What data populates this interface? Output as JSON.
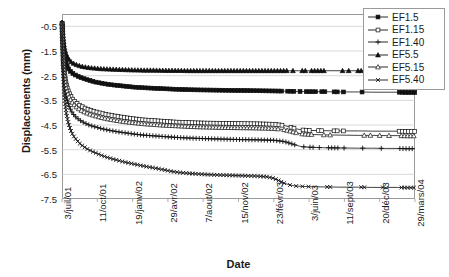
{
  "chart_data": {
    "type": "line",
    "title": "",
    "xlabel": "Date",
    "ylabel": "Displacements (mm)",
    "ylim": [
      -7.5,
      0.0
    ],
    "yticks": [
      -0.5,
      -1.5,
      -2.5,
      -3.5,
      -4.5,
      -5.5,
      -6.5,
      -7.5
    ],
    "ytick_labels": [
      "-0.5",
      "-1.5",
      "-2.5",
      "-3.5",
      "-4.5",
      "-5.5",
      "-6.5",
      "-7.5"
    ],
    "xlim": [
      0,
      1000
    ],
    "xticks": [
      0,
      100,
      200,
      300,
      400,
      500,
      600,
      700,
      800,
      900,
      1000
    ],
    "xtick_labels": [
      "3/juil/01",
      "11/oct/01",
      "19/janv/02",
      "29/avr/02",
      "7/aout/02",
      "15/nov/02",
      "23/févr/03",
      "3/juin/03",
      "11/sept/03",
      "20/déc/03",
      "29/mars/04"
    ],
    "grid": "horizontal",
    "legend_position": "top-right",
    "series": [
      {
        "name": "EF1.5",
        "marker": "filled-square",
        "color": "#111111",
        "x": [
          0,
          2,
          4,
          6,
          9,
          12,
          16,
          20,
          25,
          30,
          36,
          42,
          50,
          58,
          66,
          75,
          85,
          95,
          110,
          125,
          140,
          160,
          180,
          200,
          230,
          260,
          290,
          320,
          360,
          400,
          450,
          500,
          550,
          600,
          640,
          670,
          700,
          740,
          790,
          840,
          880,
          920,
          950,
          975,
          990,
          1000
        ],
        "y": [
          -0.25,
          -0.9,
          -1.35,
          -1.62,
          -1.86,
          -2.02,
          -2.16,
          -2.26,
          -2.34,
          -2.4,
          -2.46,
          -2.5,
          -2.56,
          -2.6,
          -2.64,
          -2.68,
          -2.72,
          -2.76,
          -2.8,
          -2.84,
          -2.87,
          -2.9,
          -2.93,
          -2.96,
          -2.99,
          -3.01,
          -3.03,
          -3.05,
          -3.07,
          -3.08,
          -3.09,
          -3.1,
          -3.11,
          -3.12,
          -3.13,
          -3.14,
          -3.15,
          -3.15,
          -3.16,
          -3.16,
          -3.17,
          -3.17,
          -3.17,
          -3.18,
          -3.18,
          -3.18
        ]
      },
      {
        "name": "EF1.15",
        "marker": "open-square",
        "color": "#111111",
        "x": [
          0,
          2,
          4,
          6,
          9,
          12,
          16,
          20,
          25,
          30,
          36,
          42,
          50,
          58,
          66,
          75,
          85,
          95,
          110,
          125,
          140,
          160,
          180,
          200,
          230,
          260,
          290,
          320,
          360,
          400,
          450,
          500,
          550,
          600,
          630,
          650,
          665,
          680,
          700,
          740,
          790,
          840,
          880,
          920,
          950,
          975,
          990,
          1000
        ],
        "y": [
          -0.25,
          -1.1,
          -1.8,
          -2.25,
          -2.6,
          -2.85,
          -3.05,
          -3.2,
          -3.34,
          -3.45,
          -3.55,
          -3.62,
          -3.7,
          -3.76,
          -3.82,
          -3.87,
          -3.92,
          -3.96,
          -4.02,
          -4.07,
          -4.11,
          -4.16,
          -4.2,
          -4.24,
          -4.29,
          -4.32,
          -4.35,
          -4.38,
          -4.4,
          -4.42,
          -4.43,
          -4.44,
          -4.45,
          -4.47,
          -4.52,
          -4.6,
          -4.66,
          -4.7,
          -4.72,
          -4.73,
          -4.74,
          -4.74,
          -4.75,
          -4.75,
          -4.75,
          -4.76,
          -4.76,
          -4.76
        ]
      },
      {
        "name": "EF1.40",
        "marker": "plus",
        "color": "#111111",
        "x": [
          0,
          2,
          4,
          6,
          9,
          12,
          16,
          20,
          25,
          30,
          36,
          42,
          50,
          58,
          66,
          75,
          85,
          95,
          110,
          125,
          140,
          160,
          180,
          200,
          230,
          260,
          290,
          320,
          360,
          400,
          450,
          500,
          550,
          600,
          630,
          650,
          665,
          680,
          700,
          740,
          790,
          840,
          880,
          920,
          950,
          975,
          990,
          1000
        ],
        "y": [
          -0.25,
          -1.25,
          -2.05,
          -2.6,
          -3.0,
          -3.3,
          -3.55,
          -3.74,
          -3.9,
          -4.02,
          -4.13,
          -4.21,
          -4.3,
          -4.37,
          -4.43,
          -4.49,
          -4.54,
          -4.58,
          -4.64,
          -4.69,
          -4.73,
          -4.78,
          -4.82,
          -4.86,
          -4.91,
          -4.94,
          -4.97,
          -5.0,
          -5.03,
          -5.05,
          -5.07,
          -5.09,
          -5.1,
          -5.12,
          -5.17,
          -5.26,
          -5.33,
          -5.38,
          -5.4,
          -5.42,
          -5.43,
          -5.44,
          -5.44,
          -5.45,
          -5.45,
          -5.46,
          -5.46,
          -5.46
        ]
      },
      {
        "name": "EF5.5",
        "marker": "filled-triangle",
        "color": "#111111",
        "x": [
          0,
          2,
          4,
          6,
          9,
          12,
          16,
          20,
          25,
          30,
          36,
          42,
          50,
          58,
          66,
          75,
          85,
          95,
          110,
          125,
          140,
          160,
          180,
          200,
          230,
          260,
          290,
          320,
          360,
          400,
          450,
          500,
          550,
          600,
          640,
          670,
          700,
          740,
          790,
          840,
          880,
          920,
          950,
          975,
          990,
          1000
        ],
        "y": [
          -0.25,
          -0.7,
          -1.05,
          -1.3,
          -1.5,
          -1.64,
          -1.76,
          -1.85,
          -1.93,
          -1.98,
          -2.03,
          -2.06,
          -2.1,
          -2.13,
          -2.15,
          -2.17,
          -2.19,
          -2.2,
          -2.22,
          -2.23,
          -2.24,
          -2.25,
          -2.26,
          -2.27,
          -2.28,
          -2.28,
          -2.29,
          -2.29,
          -2.3,
          -2.3,
          -2.3,
          -2.3,
          -2.3,
          -2.3,
          -2.3,
          -2.3,
          -2.3,
          -2.3,
          -2.3,
          -2.3,
          -2.3,
          -2.3,
          -2.3,
          -2.3,
          -2.3,
          -2.3
        ]
      },
      {
        "name": "EF5.15",
        "marker": "open-triangle",
        "color": "#111111",
        "x": [
          0,
          2,
          4,
          6,
          9,
          12,
          16,
          20,
          25,
          30,
          36,
          42,
          50,
          58,
          66,
          75,
          85,
          95,
          110,
          125,
          140,
          160,
          180,
          200,
          230,
          260,
          290,
          320,
          360,
          400,
          450,
          500,
          550,
          600,
          630,
          650,
          665,
          680,
          700,
          740,
          790,
          840,
          880,
          920,
          950,
          975,
          990,
          1000
        ],
        "y": [
          -0.25,
          -1.15,
          -1.9,
          -2.38,
          -2.74,
          -3.0,
          -3.2,
          -3.36,
          -3.5,
          -3.6,
          -3.71,
          -3.78,
          -3.87,
          -3.93,
          -3.99,
          -4.04,
          -4.09,
          -4.13,
          -4.19,
          -4.24,
          -4.28,
          -4.33,
          -4.37,
          -4.4,
          -4.45,
          -4.48,
          -4.51,
          -4.53,
          -4.56,
          -4.58,
          -4.6,
          -4.61,
          -4.62,
          -4.64,
          -4.69,
          -4.76,
          -4.82,
          -4.86,
          -4.88,
          -4.9,
          -4.91,
          -4.92,
          -4.92,
          -4.93,
          -4.93,
          -4.94,
          -4.94,
          -4.94
        ]
      },
      {
        "name": "EF5.40",
        "marker": "cross",
        "color": "#111111",
        "x": [
          0,
          2,
          4,
          6,
          9,
          12,
          16,
          20,
          25,
          30,
          36,
          42,
          50,
          58,
          66,
          75,
          85,
          95,
          110,
          125,
          140,
          160,
          180,
          200,
          230,
          260,
          290,
          310,
          330,
          360,
          400,
          450,
          500,
          550,
          580,
          600,
          615,
          630,
          645,
          660,
          680,
          700,
          740,
          790,
          840,
          880,
          920,
          950,
          975,
          990,
          1000
        ],
        "y": [
          -0.25,
          -1.5,
          -2.5,
          -3.15,
          -3.65,
          -4.0,
          -4.3,
          -4.52,
          -4.72,
          -4.88,
          -5.02,
          -5.12,
          -5.25,
          -5.34,
          -5.42,
          -5.5,
          -5.57,
          -5.63,
          -5.72,
          -5.8,
          -5.86,
          -5.94,
          -6.01,
          -6.07,
          -6.16,
          -6.24,
          -6.32,
          -6.38,
          -6.42,
          -6.46,
          -6.5,
          -6.53,
          -6.55,
          -6.57,
          -6.6,
          -6.66,
          -6.76,
          -6.86,
          -6.93,
          -6.97,
          -6.99,
          -7.0,
          -7.01,
          -7.02,
          -7.02,
          -7.03,
          -7.03,
          -7.03,
          -7.04,
          -7.04,
          -7.04
        ]
      }
    ]
  }
}
